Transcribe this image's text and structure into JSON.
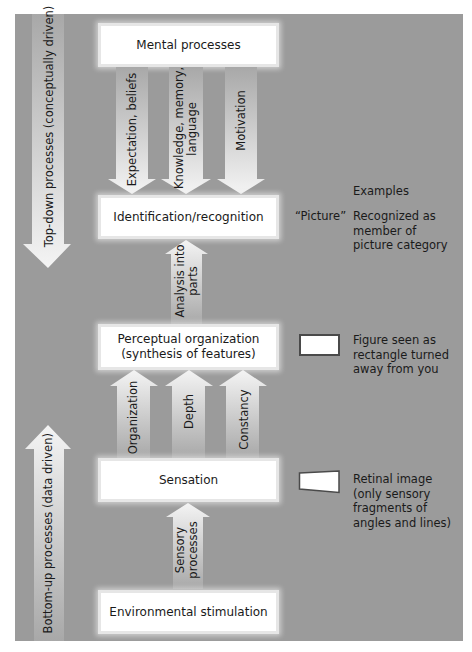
{
  "diagram": {
    "side_arrows": {
      "top_down": "Top-down processes (conceptually driven)",
      "bottom_up": "Bottom-up processes (data driven)"
    },
    "boxes": {
      "mental": "Mental processes",
      "identification": "Identification/recognition",
      "perceptual_line1": "Perceptual organization",
      "perceptual_line2": "(synthesis of features)",
      "sensation": "Sensation",
      "environment": "Environmental stimulation"
    },
    "down_arrows": [
      {
        "label": "Expectation, beliefs"
      },
      {
        "label": "Knowledge, memory,",
        "label2": "language"
      },
      {
        "label": "Motivation"
      }
    ],
    "analysis_arrow": {
      "label": "Analysis into",
      "label2": "parts"
    },
    "up_arrows": [
      {
        "label": "Organization"
      },
      {
        "label": "Depth"
      },
      {
        "label": "Constancy"
      }
    ],
    "sensory_arrow": {
      "label": "Sensory",
      "label2": "processes"
    },
    "examples": {
      "heading": "Examples",
      "picture_quote": "“Picture”",
      "recognized": "Recognized as\nmember of\npicture category",
      "figure": "Figure seen as\nrectangle turned\naway from you",
      "retinal": "Retinal image\n(only sensory\nfragments of\nangles and lines)"
    },
    "colors": {
      "panel": "#9b9b9b",
      "box": "#ffffff",
      "arrow_light": "#f2f2f2",
      "arrow_dark": "#b4b4b4",
      "text": "#1a1a1a"
    }
  }
}
